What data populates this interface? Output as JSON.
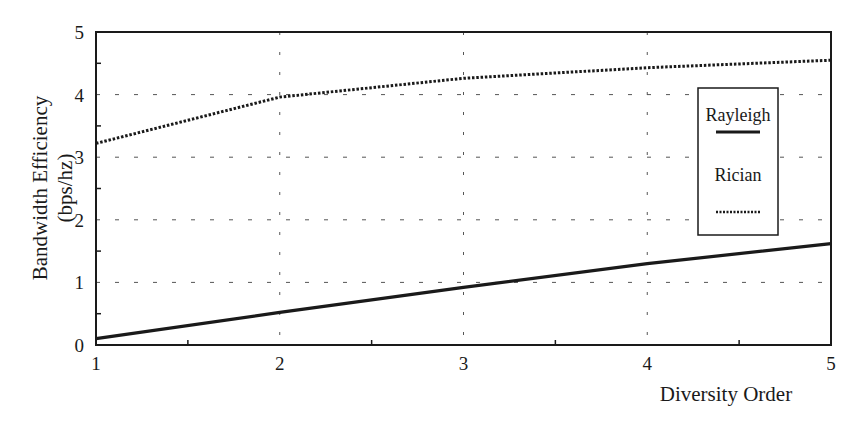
{
  "chart_data": {
    "type": "line",
    "title": "",
    "xlabel": "Diversity Order",
    "ylabel_line1": "Bandwidth Efficiency",
    "ylabel_line2": "(bps/hz)",
    "x": [
      1,
      2,
      3,
      4,
      5
    ],
    "xticks": [
      "1",
      "2",
      "3",
      "4",
      "5"
    ],
    "yticks": [
      "0",
      "1",
      "2",
      "3",
      "4",
      "5"
    ],
    "xlim": [
      1,
      5
    ],
    "ylim": [
      0,
      5
    ],
    "grid": true,
    "legend_position": "right-inside",
    "series": [
      {
        "name": "Rayleigh",
        "style": "solid",
        "values": [
          0.1,
          0.52,
          0.92,
          1.3,
          1.62
        ]
      },
      {
        "name": "Rician",
        "style": "dotted",
        "values": [
          3.22,
          3.96,
          4.26,
          4.43,
          4.55
        ]
      }
    ]
  },
  "colors": {
    "line": "#1a1a1a",
    "grid": "#555555",
    "background": "#ffffff"
  }
}
